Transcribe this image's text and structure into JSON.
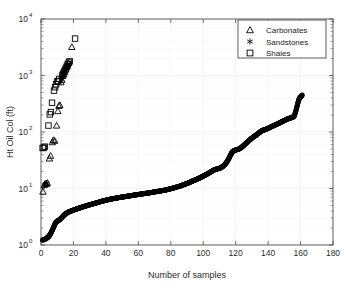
{
  "chart_data": {
    "type": "scatter",
    "title": "",
    "xlabel": "Number of samples",
    "ylabel": "Ht Oil Col (ft)",
    "xlim": [
      0,
      180
    ],
    "ylim": [
      1,
      10000
    ],
    "yscale": "log",
    "xscale": "linear",
    "grid": true,
    "xticks": [
      0,
      20,
      40,
      60,
      80,
      100,
      120,
      140,
      160,
      180
    ],
    "xtick_labels": [
      "0",
      "20",
      "40",
      "60",
      "80",
      "100",
      "120",
      "140",
      "160",
      "180"
    ],
    "yticks": [
      1,
      10,
      100,
      1000,
      10000
    ],
    "ytick_labels": [
      "10^0",
      "10^1",
      "10^2",
      "10^3",
      "10^4"
    ],
    "ytick_bases": [
      "10",
      "10",
      "10",
      "10",
      "10"
    ],
    "ytick_exponents": [
      "0",
      "1",
      "2",
      "3",
      "4"
    ],
    "legend": {
      "position": "upper-right",
      "entries": [
        {
          "label": "Carbonates",
          "marker": "triangle"
        },
        {
          "label": "Sandstones",
          "marker": "asterisk"
        },
        {
          "label": "Shales",
          "marker": "square"
        }
      ]
    },
    "series": [
      {
        "name": "Carbonates",
        "marker": "triangle",
        "points": [
          [
            1.2,
            8.8
          ],
          [
            2.0,
            11.5
          ],
          [
            2.6,
            12.2
          ],
          [
            3.3,
            12.0
          ],
          [
            3.9,
            12.6
          ],
          [
            5.2,
            34.0
          ],
          [
            5.9,
            38.0
          ],
          [
            7.0,
            66.0
          ],
          [
            7.6,
            72.0
          ],
          [
            8.4,
            70.0
          ],
          [
            9.6,
            130.0
          ],
          [
            10.4,
            235.0
          ],
          [
            11.0,
            290.0
          ],
          [
            11.6,
            300.0
          ],
          [
            12.3,
            760.0
          ],
          [
            12.9,
            840.0
          ],
          [
            13.4,
            980.0
          ],
          [
            14.0,
            1050.0
          ],
          [
            14.6,
            1150.0
          ],
          [
            15.2,
            1280.0
          ],
          [
            15.8,
            1400.0
          ],
          [
            16.3,
            1500.0
          ],
          [
            16.9,
            1650.0
          ],
          [
            19.0,
            3200.0
          ]
        ]
      },
      {
        "name": "Sandstones",
        "marker": "asterisk",
        "points": [
          [
            2.3,
            11.8
          ],
          [
            3.0,
            12.1
          ],
          [
            3.6,
            12.4
          ],
          [
            12.6,
            860.0
          ],
          [
            13.2,
            950.0
          ],
          [
            13.8,
            1020.0
          ],
          [
            14.3,
            1100.0
          ],
          [
            14.9,
            1200.0
          ],
          [
            15.5,
            1320.0
          ],
          [
            16.1,
            1440.0
          ],
          [
            16.6,
            1550.0
          ]
        ]
      },
      {
        "name": "Shales",
        "marker": "square",
        "points": [
          [
            1.0,
            52.0
          ],
          [
            1.7,
            53.0
          ],
          [
            2.4,
            55.0
          ],
          [
            4.6,
            130.0
          ],
          [
            5.4,
            205.0
          ],
          [
            6.1,
            225.0
          ],
          [
            6.8,
            330.0
          ],
          [
            8.0,
            540.0
          ],
          [
            8.7,
            620.0
          ],
          [
            9.3,
            700.0
          ],
          [
            9.9,
            780.0
          ],
          [
            10.6,
            800.0
          ],
          [
            11.3,
            870.0
          ],
          [
            13.0,
            1000.0
          ],
          [
            13.6,
            1080.0
          ],
          [
            14.2,
            1180.0
          ],
          [
            14.8,
            1270.0
          ],
          [
            15.4,
            1380.0
          ],
          [
            16.0,
            1480.0
          ],
          [
            16.5,
            1600.0
          ],
          [
            17.1,
            1700.0
          ],
          [
            17.7,
            1780.0
          ],
          [
            21.0,
            4500.0
          ]
        ]
      },
      {
        "name": "Sorted oil column heights",
        "marker": "filled-circle",
        "description": "Dense monotonically increasing sorted curve of all samples",
        "points": [
          [
            1,
            1.22
          ],
          [
            2,
            1.25
          ],
          [
            3,
            1.3
          ],
          [
            4,
            1.35
          ],
          [
            5,
            1.45
          ],
          [
            6,
            1.6
          ],
          [
            7,
            1.85
          ],
          [
            8,
            2.15
          ],
          [
            9,
            2.5
          ],
          [
            10,
            2.65
          ],
          [
            11,
            2.75
          ],
          [
            12,
            2.9
          ],
          [
            13,
            3.1
          ],
          [
            14,
            3.35
          ],
          [
            15,
            3.55
          ],
          [
            16,
            3.7
          ],
          [
            17,
            3.85
          ],
          [
            18,
            3.95
          ],
          [
            19,
            4.05
          ],
          [
            20,
            4.15
          ],
          [
            21,
            4.25
          ],
          [
            22,
            4.35
          ],
          [
            23,
            4.45
          ],
          [
            24,
            4.55
          ],
          [
            25,
            4.65
          ],
          [
            26,
            4.75
          ],
          [
            27,
            4.85
          ],
          [
            28,
            4.95
          ],
          [
            29,
            5.05
          ],
          [
            30,
            5.15
          ],
          [
            31,
            5.25
          ],
          [
            32,
            5.35
          ],
          [
            33,
            5.45
          ],
          [
            34,
            5.55
          ],
          [
            35,
            5.65
          ],
          [
            36,
            5.78
          ],
          [
            37,
            5.9
          ],
          [
            38,
            6.0
          ],
          [
            39,
            6.1
          ],
          [
            40,
            6.2
          ],
          [
            41,
            6.3
          ],
          [
            42,
            6.4
          ],
          [
            43,
            6.5
          ],
          [
            44,
            6.58
          ],
          [
            45,
            6.66
          ],
          [
            46,
            6.74
          ],
          [
            47,
            6.82
          ],
          [
            48,
            6.9
          ],
          [
            49,
            6.98
          ],
          [
            50,
            7.05
          ],
          [
            51,
            7.12
          ],
          [
            52,
            7.2
          ],
          [
            53,
            7.28
          ],
          [
            54,
            7.36
          ],
          [
            55,
            7.44
          ],
          [
            56,
            7.52
          ],
          [
            57,
            7.6
          ],
          [
            58,
            7.68
          ],
          [
            59,
            7.76
          ],
          [
            60,
            7.84
          ],
          [
            61,
            7.92
          ],
          [
            62,
            8.0
          ],
          [
            63,
            8.08
          ],
          [
            64,
            8.16
          ],
          [
            65,
            8.24
          ],
          [
            66,
            8.32
          ],
          [
            67,
            8.4
          ],
          [
            68,
            8.5
          ],
          [
            69,
            8.6
          ],
          [
            70,
            8.7
          ],
          [
            71,
            8.8
          ],
          [
            72,
            8.9
          ],
          [
            73,
            9.0
          ],
          [
            74,
            9.1
          ],
          [
            75,
            9.2
          ],
          [
            76,
            9.3
          ],
          [
            77,
            9.45
          ],
          [
            78,
            9.6
          ],
          [
            79,
            9.75
          ],
          [
            80,
            9.9
          ],
          [
            81,
            10.1
          ],
          [
            82,
            10.3
          ],
          [
            83,
            10.5
          ],
          [
            84,
            10.7
          ],
          [
            85,
            10.9
          ],
          [
            86,
            11.1
          ],
          [
            87,
            11.4
          ],
          [
            88,
            11.7
          ],
          [
            89,
            12.0
          ],
          [
            90,
            12.3
          ],
          [
            91,
            12.6
          ],
          [
            92,
            13.0
          ],
          [
            93,
            13.4
          ],
          [
            94,
            13.8
          ],
          [
            95,
            14.2
          ],
          [
            96,
            14.6
          ],
          [
            97,
            15.0
          ],
          [
            98,
            15.5
          ],
          [
            99,
            16.0
          ],
          [
            100,
            16.6
          ],
          [
            101,
            17.2
          ],
          [
            102,
            17.8
          ],
          [
            103,
            18.5
          ],
          [
            104,
            19.2
          ],
          [
            105,
            20.0
          ],
          [
            106,
            20.8
          ],
          [
            107,
            21.5
          ],
          [
            108,
            22.0
          ],
          [
            109,
            22.4
          ],
          [
            110,
            22.8
          ],
          [
            111,
            23.5
          ],
          [
            112,
            24.5
          ],
          [
            113,
            26.0
          ],
          [
            114,
            28.0
          ],
          [
            115,
            31.0
          ],
          [
            116,
            35.0
          ],
          [
            117,
            40.0
          ],
          [
            118,
            45.0
          ],
          [
            119,
            47.0
          ],
          [
            120,
            48.0
          ],
          [
            121,
            49.0
          ],
          [
            122,
            50.0
          ],
          [
            123,
            52.0
          ],
          [
            124,
            55.0
          ],
          [
            125,
            58.0
          ],
          [
            126,
            62.0
          ],
          [
            127,
            66.0
          ],
          [
            128,
            70.0
          ],
          [
            129,
            74.0
          ],
          [
            130,
            78.0
          ],
          [
            131,
            82.0
          ],
          [
            132,
            86.0
          ],
          [
            133,
            90.0
          ],
          [
            134,
            95.0
          ],
          [
            135,
            100.0
          ],
          [
            136,
            105.0
          ],
          [
            137,
            108.0
          ],
          [
            138,
            110.0
          ],
          [
            139,
            113.0
          ],
          [
            140,
            116.0
          ],
          [
            141,
            120.0
          ],
          [
            142,
            124.0
          ],
          [
            143,
            128.0
          ],
          [
            144,
            132.0
          ],
          [
            145,
            136.0
          ],
          [
            146,
            140.0
          ],
          [
            147,
            145.0
          ],
          [
            148,
            150.0
          ],
          [
            149,
            155.0
          ],
          [
            150,
            160.0
          ],
          [
            151,
            165.0
          ],
          [
            152,
            170.0
          ],
          [
            153,
            175.0
          ],
          [
            154,
            178.0
          ],
          [
            155,
            182.0
          ],
          [
            156,
            190.0
          ],
          [
            157,
            230.0
          ],
          [
            158,
            300.0
          ],
          [
            159,
            380.0
          ],
          [
            160,
            420.0
          ],
          [
            161,
            450.0
          ]
        ]
      }
    ]
  },
  "figure": {
    "background": "#ffffff",
    "axis_color": "#4d4d4d",
    "grid_color": "#efefef",
    "marker_color": "#000000"
  }
}
